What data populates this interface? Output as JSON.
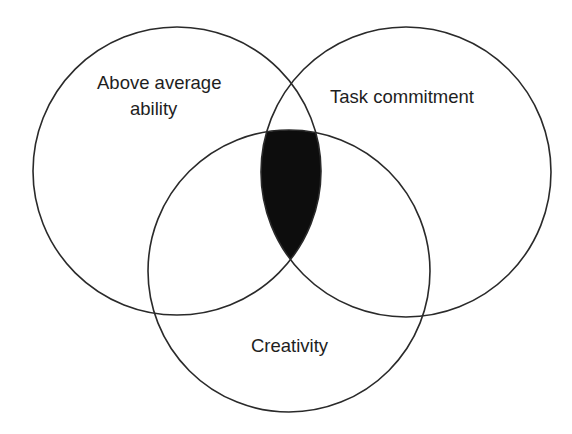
{
  "diagram": {
    "type": "venn",
    "circles": [
      {
        "id": "ability",
        "label_lines": [
          "Above average",
          "ability"
        ],
        "cx": 177,
        "cy": 171,
        "r": 144
      },
      {
        "id": "commitment",
        "label_lines": [
          "Task commitment"
        ],
        "cx": 406,
        "cy": 172,
        "r": 145
      },
      {
        "id": "creativity",
        "label_lines": [
          "Creativity"
        ],
        "cx": 289,
        "cy": 271,
        "r": 141
      }
    ],
    "highlight": {
      "region": "intersection of all three",
      "color": "#0d0d0d"
    },
    "stroke_color": "#2a2a2a",
    "background": "#ffffff"
  }
}
